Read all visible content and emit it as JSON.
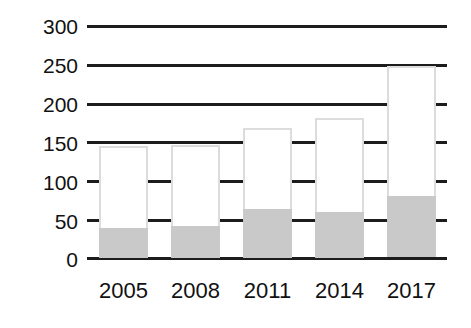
{
  "chart_data": {
    "type": "bar",
    "stacked": true,
    "title": "",
    "subtitle": "",
    "xlabel": "",
    "ylabel": "",
    "categories": [
      "2005",
      "2008",
      "2011",
      "2014",
      "2017"
    ],
    "ylim": [
      0,
      300
    ],
    "yticks": [
      0,
      50,
      100,
      150,
      200,
      250,
      300
    ],
    "ytick_labels": [
      "0",
      "50",
      "100",
      "150",
      "200",
      "250",
      "300"
    ],
    "grid": true,
    "legend": "none",
    "series": [
      {
        "name": "lower-segment",
        "color": "#c9c9c9",
        "values": [
          38,
          41,
          63,
          59,
          79
        ]
      },
      {
        "name": "upper-segment",
        "color": "#ffffff",
        "values": [
          106,
          104,
          104,
          121,
          168
        ]
      }
    ],
    "totals": [
      144,
      145,
      167,
      180,
      247
    ]
  },
  "axes": {
    "y_tick_labels": [
      "300",
      "250",
      "200",
      "150",
      "100",
      "50",
      "0"
    ],
    "x_tick_labels": [
      "2005",
      "2008",
      "2011",
      "2014",
      "2017"
    ]
  },
  "colors": {
    "gridline": "#1c1c1c",
    "bar_fill_lower": "#c9c9c9",
    "bar_fill_upper": "#ffffff",
    "bar_outline": "#dcdcdc",
    "text": "#111111",
    "background": "#ffffff"
  }
}
